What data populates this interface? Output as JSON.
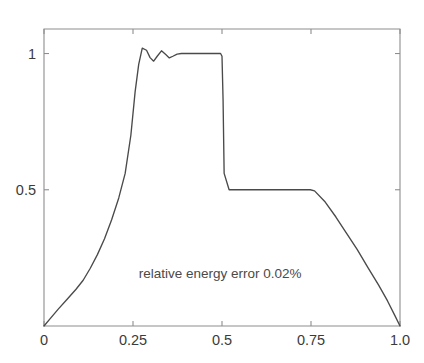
{
  "chart_data": {
    "type": "line",
    "title": "",
    "subtitle": "",
    "xlabel": "",
    "ylabel": "",
    "xlim": [
      0,
      1.0
    ],
    "ylim": [
      0,
      1.09
    ],
    "grid": false,
    "legend": null,
    "legend_position": "none",
    "xticks": [
      0,
      0.25,
      0.5,
      0.75,
      1.0
    ],
    "xtick_labels": [
      "0",
      "0.25",
      "0.5",
      "0.75",
      "1.0"
    ],
    "yticks": [
      0.5,
      1.0
    ],
    "ytick_labels": [
      "0.5",
      "1"
    ],
    "annotations": [
      {
        "text": "relative energy error 0.02%",
        "x": 0.495,
        "y": 0.175
      }
    ],
    "series": [
      {
        "name": "reconstructed signal envelope",
        "color": "#4a4a4a",
        "x": [
          0.0,
          0.018,
          0.04,
          0.065,
          0.09,
          0.11,
          0.13,
          0.15,
          0.17,
          0.19,
          0.21,
          0.228,
          0.244,
          0.256,
          0.266,
          0.276,
          0.288,
          0.298,
          0.308,
          0.318,
          0.33,
          0.342,
          0.352,
          0.362,
          0.374,
          0.386,
          0.4,
          0.42,
          0.45,
          0.48,
          0.496,
          0.5,
          0.503,
          0.506,
          0.52,
          0.56,
          0.62,
          0.68,
          0.72,
          0.748,
          0.76,
          0.79,
          0.82,
          0.85,
          0.88,
          0.91,
          0.94,
          0.965,
          0.985,
          1.0
        ],
        "y": [
          0.0,
          0.028,
          0.062,
          0.098,
          0.135,
          0.168,
          0.212,
          0.262,
          0.32,
          0.39,
          0.47,
          0.56,
          0.7,
          0.86,
          0.96,
          1.02,
          1.012,
          0.985,
          0.972,
          0.99,
          1.01,
          0.996,
          0.984,
          0.99,
          0.998,
          1.0,
          1.0,
          1.0,
          1.0,
          1.0,
          1.0,
          0.99,
          0.83,
          0.56,
          0.5,
          0.5,
          0.5,
          0.5,
          0.5,
          0.5,
          0.496,
          0.455,
          0.4,
          0.34,
          0.28,
          0.214,
          0.15,
          0.092,
          0.04,
          0.0
        ]
      }
    ],
    "plot_box": {
      "left": 44,
      "right": 400,
      "top": 29,
      "bottom": 326
    },
    "axis_color": "#8e8e8e",
    "background_color": "#ffffff"
  }
}
